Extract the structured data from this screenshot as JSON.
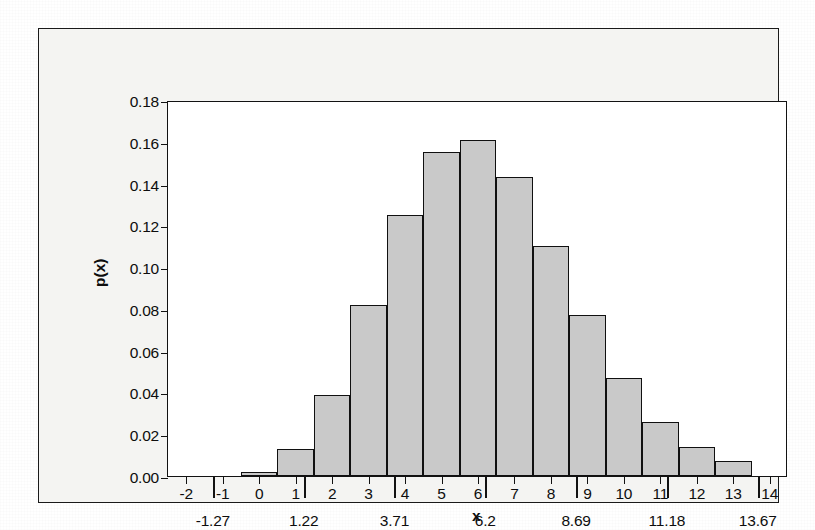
{
  "figure": {
    "background_color": "#f4f4f2",
    "frame_color": "#1a1a1a",
    "bar_fill_color": "#c9c9c9",
    "bar_edge_color": "#101010"
  },
  "chart_data": {
    "type": "bar",
    "title": "",
    "subtitle": "",
    "xlabel": "x",
    "ylabel": "p(x)",
    "grid": false,
    "legend": null,
    "xlim": [
      -2.5,
      14.5
    ],
    "ylim": [
      0.0,
      0.18
    ],
    "bar_width": 1.0,
    "bar_align": "left-edge-at-x-minus-half",
    "x_tick_labels": [
      "-2",
      "-1",
      "0",
      "1",
      "2",
      "3",
      "4",
      "5",
      "6",
      "7",
      "8",
      "9",
      "10",
      "11",
      "12",
      "13",
      "14"
    ],
    "x_tick_values": [
      -2,
      -1,
      0,
      1,
      2,
      3,
      4,
      5,
      6,
      7,
      8,
      9,
      10,
      11,
      12,
      13,
      14
    ],
    "x_major_tick_labels": [
      "-1.27",
      "1.22",
      "3.71",
      "6.2",
      "8.69",
      "11.18",
      "13.67"
    ],
    "x_major_tick_values": [
      -1.27,
      1.22,
      3.71,
      6.2,
      8.69,
      11.18,
      13.67
    ],
    "y_tick_labels": [
      "0.00",
      "0.02",
      "0.04",
      "0.06",
      "0.08",
      "0.10",
      "0.12",
      "0.14",
      "0.16",
      "0.18"
    ],
    "y_tick_values": [
      0.0,
      0.02,
      0.04,
      0.06,
      0.08,
      0.1,
      0.12,
      0.14,
      0.16,
      0.18
    ],
    "categories": [
      0,
      1,
      2,
      3,
      4,
      5,
      6,
      7,
      8,
      9,
      10,
      11,
      12,
      13
    ],
    "bar_left_edges": [
      -0.5,
      0.5,
      1.5,
      2.5,
      3.5,
      4.5,
      5.5,
      6.5,
      7.5,
      8.5,
      9.5,
      10.5,
      11.5,
      12.5
    ],
    "values": [
      0.002,
      0.013,
      0.039,
      0.082,
      0.125,
      0.155,
      0.161,
      0.143,
      0.11,
      0.077,
      0.047,
      0.026,
      0.014,
      0.007
    ]
  }
}
